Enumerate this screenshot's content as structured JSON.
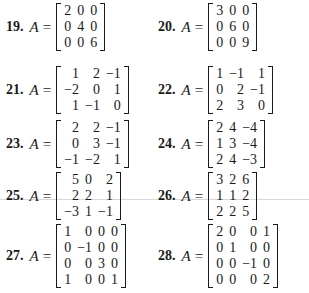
{
  "problems": [
    {
      "number": "19.",
      "lhs": "A",
      "eq": "=",
      "matrix": [
        [
          "2",
          "0",
          "0"
        ],
        [
          "0",
          "4",
          "0"
        ],
        [
          "0",
          "0",
          "6"
        ]
      ]
    },
    {
      "number": "20.",
      "lhs": "A",
      "eq": "=",
      "matrix": [
        [
          "3",
          "0",
          "0"
        ],
        [
          "0",
          "6",
          "0"
        ],
        [
          "0",
          "0",
          "9"
        ]
      ]
    },
    {
      "number": "21.",
      "lhs": "A",
      "eq": "=",
      "matrix": [
        [
          "1",
          "2",
          "−1"
        ],
        [
          "−2",
          "0",
          "1"
        ],
        [
          "1",
          "−1",
          "0"
        ]
      ]
    },
    {
      "number": "22.",
      "lhs": "A",
      "eq": "=",
      "matrix": [
        [
          "1",
          "−1",
          "1"
        ],
        [
          "0",
          "2",
          "−1"
        ],
        [
          "2",
          "3",
          "0"
        ]
      ]
    },
    {
      "number": "23.",
      "lhs": "A",
      "eq": "=",
      "matrix": [
        [
          "2",
          "2",
          "−1"
        ],
        [
          "0",
          "3",
          "−1"
        ],
        [
          "−1",
          "−2",
          "1"
        ]
      ]
    },
    {
      "number": "24.",
      "lhs": "A",
      "eq": "=",
      "matrix": [
        [
          "2",
          "4",
          "−4"
        ],
        [
          "1",
          "3",
          "−4"
        ],
        [
          "2",
          "4",
          "−3"
        ]
      ]
    },
    {
      "number": "25.",
      "lhs": "A",
      "eq": "=",
      "matrix": [
        [
          "5",
          "0",
          "2"
        ],
        [
          "2",
          "2",
          "1"
        ],
        [
          "−3",
          "1",
          "−1"
        ]
      ]
    },
    {
      "number": "26.",
      "lhs": "A",
      "eq": "=",
      "matrix": [
        [
          "3",
          "2",
          "6"
        ],
        [
          "1",
          "1",
          "2"
        ],
        [
          "2",
          "2",
          "5"
        ]
      ]
    },
    {
      "number": "27.",
      "lhs": "A",
      "eq": "=",
      "matrix": [
        [
          "1",
          "0",
          "0",
          "0"
        ],
        [
          "0",
          "−1",
          "0",
          "0"
        ],
        [
          "0",
          "0",
          "3",
          "0"
        ],
        [
          "1",
          "0",
          "0",
          "1"
        ]
      ]
    },
    {
      "number": "28.",
      "lhs": "A",
      "eq": "=",
      "matrix": [
        [
          "2",
          "0",
          "0",
          "1"
        ],
        [
          "0",
          "1",
          "0",
          "0"
        ],
        [
          "0",
          "0",
          "−1",
          "0"
        ],
        [
          "0",
          "0",
          "0",
          "2"
        ]
      ]
    }
  ]
}
